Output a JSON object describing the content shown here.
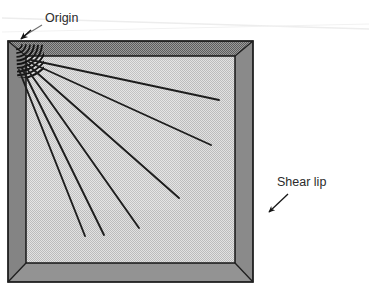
{
  "figure": {
    "kind": "fatigue-fracture-surface-diagram",
    "background_color": "#ffffff",
    "scan_artifact_line_color": "#e9e9e9"
  },
  "specimen": {
    "name": "square-fracture-specimen",
    "outer_rect": {
      "x": 8,
      "y": 41,
      "width": 245,
      "height": 241
    },
    "inner_rect": {
      "x": 26,
      "y": 56,
      "width": 209,
      "height": 207
    },
    "shear_lip_fill": "#8d8d8d",
    "shear_lip_fill_light": "#9a9a9a",
    "fracture_face_fill": "#d2d2d2",
    "outline_color": "#1a1a1a",
    "outline_width": 1.6,
    "miter_line_color": "#1f1f1f"
  },
  "origin": {
    "name": "fatigue-crack-origin",
    "center_x": 16,
    "center_y": 44,
    "beach_mark_color": "#141414",
    "beach_mark_count": 9,
    "beach_mark_radii": [
      6,
      10,
      14,
      18,
      22,
      26,
      30,
      34,
      38
    ],
    "beach_mark_start_angle_deg": 2,
    "beach_mark_end_angle_deg": 88
  },
  "river_marks": {
    "name": "radiating-river-marks",
    "stroke_color": "#1d1d1d",
    "stroke_width": 1.9,
    "rays": [
      {
        "x1": 31,
        "y1": 60,
        "x2": 219,
        "y2": 100
      },
      {
        "x1": 29,
        "y1": 62,
        "x2": 211,
        "y2": 145
      },
      {
        "x1": 27,
        "y1": 64,
        "x2": 179,
        "y2": 198
      },
      {
        "x1": 25,
        "y1": 66,
        "x2": 139,
        "y2": 228
      },
      {
        "x1": 22,
        "y1": 68,
        "x2": 104,
        "y2": 235
      },
      {
        "x1": 19,
        "y1": 70,
        "x2": 85,
        "y2": 236
      }
    ]
  },
  "annotations": {
    "origin": {
      "name": "origin-annotation",
      "label": "Origin",
      "text_x": 45,
      "text_y": 22,
      "leader": {
        "x1": 42,
        "y1": 25,
        "x2": 24,
        "y2": 36
      },
      "arrow_tip": {
        "x": 20,
        "y": 40
      },
      "leader_color": "#6a6a6a",
      "arrow_color": "#1a1a1a"
    },
    "shear_lip": {
      "name": "shear-lip-annotation",
      "label": "Shear lip",
      "text_x": 277,
      "text_y": 186,
      "leader": {
        "x1": 288,
        "y1": 194,
        "x2": 268,
        "y2": 213
      },
      "arrow_tip": {
        "x": 257,
        "y": 224
      },
      "leader_color": "#1a1a1a",
      "arrow_color": "#1a1a1a"
    }
  }
}
